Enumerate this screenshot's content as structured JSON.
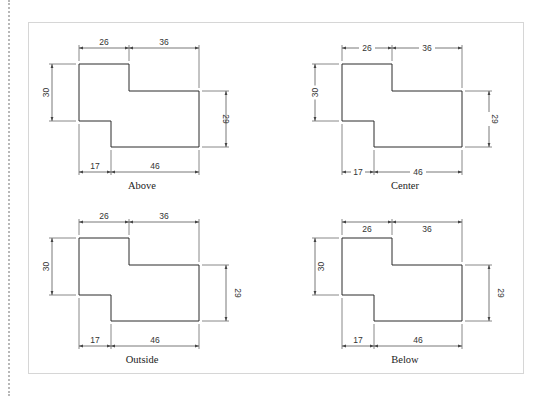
{
  "diagram": {
    "panels": [
      {
        "id": "above",
        "caption": "Above",
        "text_placement": "above",
        "dimensions": {
          "top_left": "26",
          "top_right": "36",
          "left": "30",
          "right": "29",
          "bottom_left": "17",
          "bottom_right": "46"
        }
      },
      {
        "id": "center",
        "caption": "Center",
        "text_placement": "center",
        "dimensions": {
          "top_left": "26",
          "top_right": "36",
          "left": "30",
          "right": "29",
          "bottom_left": "17",
          "bottom_right": "46"
        }
      },
      {
        "id": "outside",
        "caption": "Outside",
        "text_placement": "outside",
        "dimensions": {
          "top_left": "26",
          "top_right": "36",
          "left": "30",
          "right": "29",
          "bottom_left": "17",
          "bottom_right": "46"
        }
      },
      {
        "id": "below",
        "caption": "Below",
        "text_placement": "below",
        "dimensions": {
          "top_left": "26",
          "top_right": "36",
          "left": "30",
          "right": "29",
          "bottom_left": "17",
          "bottom_right": "46"
        }
      }
    ]
  }
}
